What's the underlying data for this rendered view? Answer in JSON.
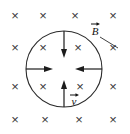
{
  "figure": {
    "background_color": "#ffffff",
    "width": 130,
    "height": 134,
    "field_symbol": "×",
    "field_symbol_name": "field-into-page-x",
    "field_color": "#3a3a3a",
    "line_color": "#2b2b2b",
    "arrow_color": "#1c1c1c",
    "field_grid": {
      "rows": 4,
      "columns": 4,
      "x_positions": [
        15,
        43,
        75,
        113
      ],
      "y_positions": [
        17,
        49,
        88,
        121
      ],
      "marks": [
        [
          "×",
          "×",
          "×",
          "×"
        ],
        [
          "×",
          "×",
          "×",
          "×"
        ],
        [
          "×",
          "×",
          "×",
          "×"
        ],
        [
          "×",
          "×",
          "×",
          "×"
        ]
      ]
    },
    "loop": {
      "name": "conducting-loop",
      "center_x": 64,
      "center_y": 69,
      "radius": 38
    },
    "arrows": [
      {
        "name": "velocity-arrow-top",
        "direction": "down",
        "from_x": 64,
        "from_y": 31,
        "to_x": 64,
        "to_y": 57
      },
      {
        "name": "velocity-arrow-bottom",
        "direction": "up",
        "from_x": 64,
        "from_y": 107,
        "to_x": 64,
        "to_y": 81
      },
      {
        "name": "velocity-arrow-left",
        "direction": "right",
        "from_x": 26,
        "from_y": 69,
        "to_x": 52,
        "to_y": 69
      },
      {
        "name": "velocity-arrow-right",
        "direction": "left",
        "from_x": 102,
        "from_y": 69,
        "to_x": 76,
        "to_y": 69
      }
    ],
    "labels": {
      "magnetic_field": {
        "text": "B",
        "name": "magnetic-field-label",
        "x": 95,
        "y": 34,
        "has_vector_arrow": true,
        "leader_from_x": 101,
        "leader_from_y": 38,
        "leader_to_x": 117,
        "leader_to_y": 48
      },
      "velocity": {
        "text": "v",
        "name": "velocity-label",
        "x": 74,
        "y": 104,
        "has_vector_arrow": true
      }
    }
  }
}
